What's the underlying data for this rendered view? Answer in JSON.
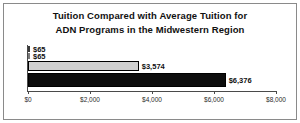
{
  "chart_data": {
    "type": "bar",
    "orientation": "horizontal",
    "title": "Tuition Compared with Average Tuition for ADN Programs in the Midwestern Region",
    "title_lines": [
      "Tuition Compared with Average Tuition for",
      "ADN Programs in the Midwestern Region"
    ],
    "xlabel": "",
    "ylabel": "",
    "xlim": [
      0,
      8000
    ],
    "grid": false,
    "legend": false,
    "categories": [
      "Series 1",
      "Series 2",
      "Series 3",
      "Series 4"
    ],
    "values": [
      65,
      65,
      3574,
      6376
    ],
    "data_labels": [
      "$65",
      "$65",
      "$3,574",
      "$6,376"
    ],
    "bar_colors": [
      "#3a3a3a",
      "#7a7a7a",
      "#d0d0d0",
      "#0d0d0d"
    ],
    "xticks": [
      0,
      2000,
      4000,
      6000,
      8000
    ],
    "xtick_labels": [
      "$0",
      "$2,000",
      "$4,000",
      "$6,000",
      "$8,000"
    ]
  },
  "style": {
    "frame_border_color": "#8a8a8a",
    "axis_color": "#4a4a4a",
    "background": "#ffffff"
  }
}
